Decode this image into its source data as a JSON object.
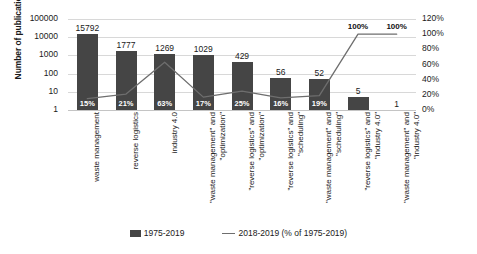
{
  "chart_data": {
    "type": "bar",
    "title": "",
    "xlabel": "",
    "ylabel": "Number of publications",
    "y2label": "",
    "grid": true,
    "legend_position": "bottom",
    "yscale": "log",
    "ylim": [
      1,
      100000
    ],
    "yticks": [
      "1",
      "10",
      "100",
      "1000",
      "10000",
      "100000"
    ],
    "y2lim": [
      0,
      120
    ],
    "y2ticks": [
      "0%",
      "20%",
      "40%",
      "60%",
      "80%",
      "100%",
      "120%"
    ],
    "categories": [
      "waste management",
      "reverse logistics",
      "industry 4.0",
      "\"waste management\" and\n\"optimization\"",
      "\"reverse logistics\" and\n\"optimization\"",
      "\"reverse logistics\" and\n\"scheduling\"",
      "\"waste management\" and\n\"scheduling\"",
      "\"reverse logistics\" and\n\"industry 4.0\"",
      "\"waste management\" and\n\"industry 4.0\""
    ],
    "series": [
      {
        "name": "1975-2019",
        "type": "bar",
        "axis": "left",
        "values": [
          15792,
          1777,
          1269,
          1029,
          429,
          56,
          52,
          5,
          1
        ],
        "labels": [
          "15792",
          "1777",
          "1269",
          "1029",
          "429",
          "56",
          "52",
          "5",
          "1"
        ],
        "color": "#454545"
      },
      {
        "name": "2018-2019 (% of 1975-2019)",
        "type": "line",
        "axis": "right",
        "values": [
          15,
          21,
          63,
          17,
          25,
          16,
          19,
          100,
          100
        ],
        "labels": [
          "15%",
          "21%",
          "63%",
          "17%",
          "25%",
          "16%",
          "19%",
          "100%",
          "100%"
        ],
        "color": "#6e6e6e"
      }
    ]
  },
  "legend": {
    "items": [
      {
        "label": "1975-2019",
        "marker": "bar-swatch"
      },
      {
        "label": "2018-2019 (% of 1975-2019)",
        "marker": "line-swatch"
      }
    ]
  }
}
